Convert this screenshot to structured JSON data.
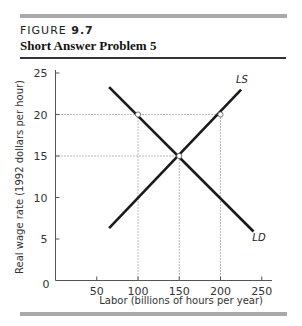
{
  "header": {
    "figure_prefix": "FIGURE ",
    "figure_number": "9.7",
    "title": "Short Answer Problem 5"
  },
  "chart_data": {
    "type": "line",
    "title": "Short Answer Problem 5",
    "xlabel": "Labor (billions of hours per year)",
    "ylabel": "Real wage rate (1992 dollars per hour)",
    "xlim": [
      0,
      250
    ],
    "ylim": [
      0,
      25
    ],
    "x_ticks": [
      "50",
      "100",
      "150",
      "200",
      "250"
    ],
    "y_ticks": [
      "5",
      "10",
      "15",
      "20",
      "25"
    ],
    "origin_label": "0",
    "grid": false,
    "series": [
      {
        "name": "LS",
        "label": "LS",
        "points": [
          [
            65,
            6.3
          ],
          [
            225,
            23.0
          ]
        ]
      },
      {
        "name": "LD",
        "label": "LD",
        "points": [
          [
            65,
            23.3
          ],
          [
            240,
            5.9
          ]
        ]
      }
    ],
    "marked_points": [
      {
        "x": 100,
        "y": 20
      },
      {
        "x": 150,
        "y": 15
      },
      {
        "x": 200,
        "y": 20
      }
    ],
    "reference_lines": [
      {
        "type": "horizontal",
        "y": 20,
        "from_x": 0,
        "to_x": 200,
        "style": "dotted"
      },
      {
        "type": "horizontal",
        "y": 15,
        "from_x": 0,
        "to_x": 150,
        "style": "dotted"
      },
      {
        "type": "vertical",
        "x": 100,
        "from_y": 0,
        "to_y": 20,
        "style": "dotted"
      },
      {
        "type": "vertical",
        "x": 150,
        "from_y": 0,
        "to_y": 15,
        "style": "dotted"
      },
      {
        "type": "vertical",
        "x": 200,
        "from_y": 0,
        "to_y": 20,
        "style": "dotted"
      }
    ]
  }
}
